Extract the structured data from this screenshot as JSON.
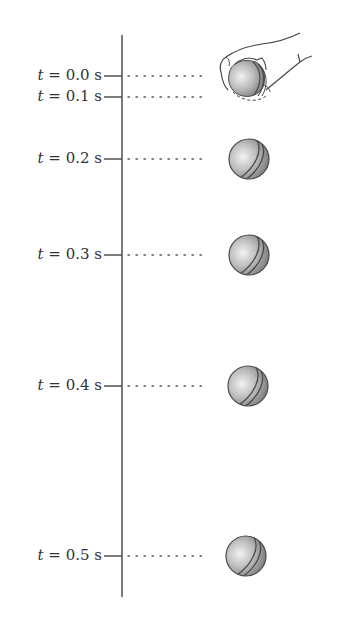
{
  "diagram": {
    "type": "motion-strobe-diagram",
    "axis": {
      "x": 122,
      "y_top": 35,
      "y_bottom": 597,
      "color": "#444444"
    },
    "ball_x_center": 248,
    "ball_radius": 20,
    "colors": {
      "ink": "#444444",
      "ball_light": "#e8e8e8",
      "ball_mid": "#b0b0b0",
      "ball_dark": "#6e6e6e",
      "seam": "#555555"
    },
    "timestamps": [
      {
        "var": "t",
        "eq": " = ",
        "value": "0.0",
        "unit": " s",
        "y": 76,
        "ball_y": 80,
        "in_hand": true
      },
      {
        "var": "t",
        "eq": " = ",
        "value": "0.1",
        "unit": " s",
        "y": 97,
        "ball_y": null,
        "in_hand": true
      },
      {
        "var": "t",
        "eq": " = ",
        "value": "0.2",
        "unit": " s",
        "y": 159,
        "ball_y": 159,
        "in_hand": false
      },
      {
        "var": "t",
        "eq": " = ",
        "value": "0.3",
        "unit": " s",
        "y": 255,
        "ball_y": 255,
        "in_hand": false
      },
      {
        "var": "t",
        "eq": " = ",
        "value": "0.4",
        "unit": " s",
        "y": 386,
        "ball_y": 386,
        "in_hand": false
      },
      {
        "var": "t",
        "eq": " = ",
        "value": "0.5",
        "unit": " s",
        "y": 556,
        "ball_y": 556,
        "in_hand": false
      }
    ],
    "labels": {
      "t0": "0.0",
      "t1": "0.1",
      "t2": "0.2",
      "t3": "0.3",
      "t4": "0.4",
      "t5": "0.5",
      "var": "t",
      "eq": " = ",
      "unit": " s"
    }
  }
}
